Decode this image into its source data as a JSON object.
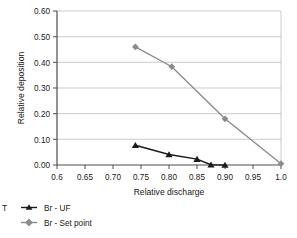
{
  "chart_data": {
    "type": "line",
    "title": "",
    "subtitle": "",
    "xlabel": "Relative discharge",
    "ylabel": "Relative deposition",
    "xlim": [
      0.6,
      1.0
    ],
    "ylim": [
      0.0,
      0.6
    ],
    "grid": "horizontal",
    "legend_position": "bottom-left",
    "x_ticks": [
      "0.6",
      "0.65",
      "0.70",
      "0.75",
      "0.80",
      "0.85",
      "0.90",
      "0.95",
      "1.0"
    ],
    "x_tick_values": [
      0.6,
      0.65,
      0.7,
      0.75,
      0.8,
      0.85,
      0.9,
      0.95,
      1.0
    ],
    "y_ticks": [
      "0.00",
      "0.10",
      "0.20",
      "0.30",
      "0.40",
      "0.50",
      "0.60"
    ],
    "y_tick_values": [
      0.0,
      0.1,
      0.2,
      0.3,
      0.4,
      0.5,
      0.6
    ],
    "series": [
      {
        "name": "Br - UF",
        "color": "#1a1a1a",
        "marker": "triangle",
        "x": [
          0.74,
          0.8,
          0.85,
          0.875,
          0.9
        ],
        "y": [
          0.077,
          0.041,
          0.023,
          0.001,
          0.0
        ]
      },
      {
        "name": "Br - Set point",
        "color": "#8c8c8c",
        "marker": "diamond",
        "x": [
          0.74,
          0.805,
          0.9,
          1.0
        ],
        "y": [
          0.46,
          0.383,
          0.18,
          0.005
        ]
      }
    ]
  },
  "legend": {
    "items": [
      {
        "label": "Br - UF",
        "color": "#1a1a1a",
        "marker": "triangle"
      },
      {
        "label": "Br - Set point",
        "color": "#8c8c8c",
        "marker": "diamond"
      }
    ]
  },
  "cropped_fragment": {
    "label": "T"
  }
}
